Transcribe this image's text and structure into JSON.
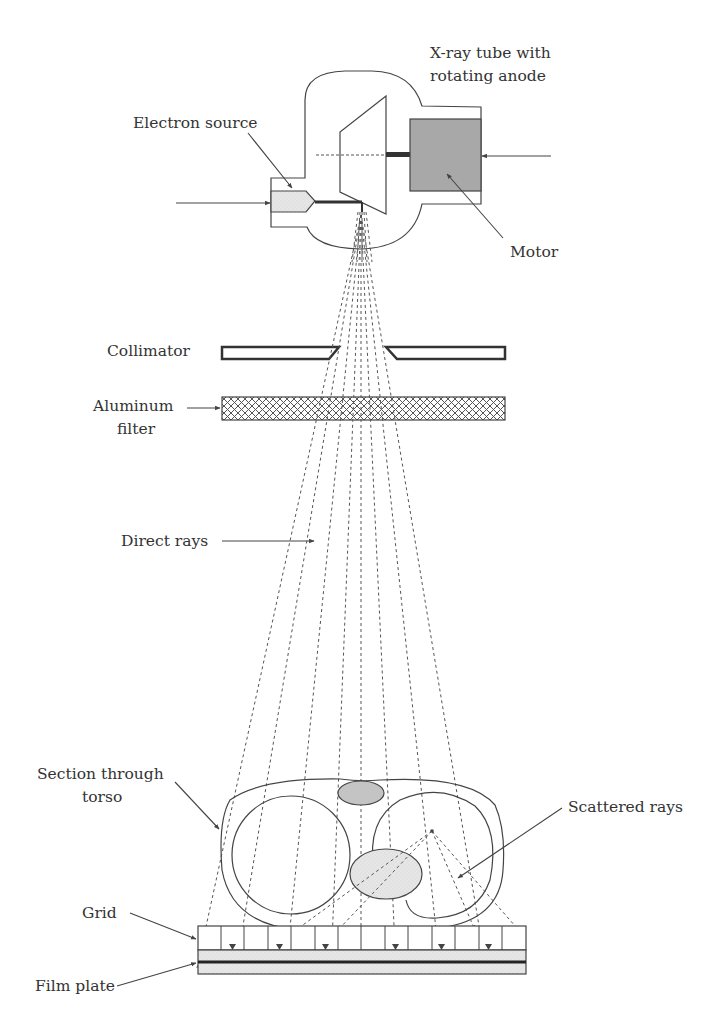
{
  "diagram": {
    "type": "schematic",
    "labels": {
      "xray_tube_line1": "X-ray tube with",
      "xray_tube_line2": "rotating anode",
      "electron_source": "Electron source",
      "motor": "Motor",
      "collimator": "Collimator",
      "aluminum_filter_line1": "Aluminum",
      "aluminum_filter_line2": "filter",
      "direct_rays": "Direct rays",
      "section_torso_line1": "Section through",
      "section_torso_line2": "torso",
      "scattered_rays": "Scattered rays",
      "grid": "Grid",
      "film_plate": "Film plate"
    },
    "colors": {
      "line": "#444444",
      "motor_fill": "#a8a8a8",
      "organ_fill": "#c8c8c8",
      "light_fill": "#e8e8e8",
      "background": "#ffffff"
    },
    "components": [
      {
        "name": "X-ray tube",
        "description": "vacuum envelope with rotating anode"
      },
      {
        "name": "Electron source",
        "description": "cathode emitting electron beam toward anode"
      },
      {
        "name": "Motor",
        "description": "drives rotating anode"
      },
      {
        "name": "Collimator",
        "description": "two plates restricting beam"
      },
      {
        "name": "Aluminum filter",
        "description": "cross-hatched plate removing low-energy photons"
      },
      {
        "name": "Direct rays",
        "description": "diverging dashed lines from focal spot"
      },
      {
        "name": "Section through torso",
        "description": "cross section with two lungs, heart and spine"
      },
      {
        "name": "Scattered rays",
        "description": "dashed rays scattered from a point inside the right lung"
      },
      {
        "name": "Grid",
        "description": "anti-scatter grid of vertical septa"
      },
      {
        "name": "Film plate",
        "description": "image receptor beneath grid"
      }
    ]
  }
}
